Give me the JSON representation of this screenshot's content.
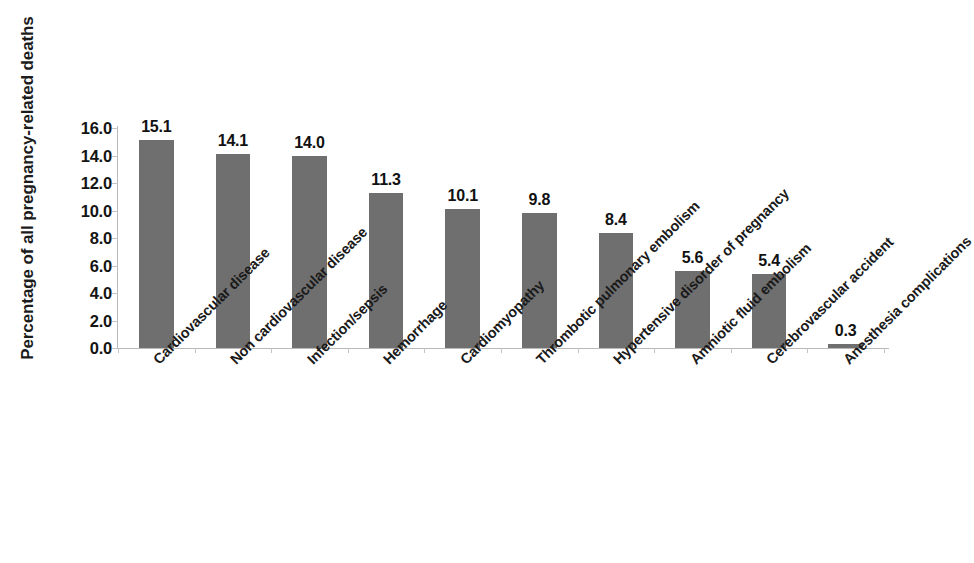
{
  "chart_data": {
    "type": "bar",
    "title": "",
    "xlabel": "",
    "ylabel": "Percentage of all pregnancy-related deaths",
    "ylim": [
      0,
      16
    ],
    "ytick_labels": [
      "16.0",
      "14.0",
      "12.0",
      "10.0",
      "8.0",
      "6.0",
      "4.0",
      "2.0",
      "0.0"
    ],
    "ytick_values": [
      16,
      14,
      12,
      10,
      8,
      6,
      4,
      2,
      0
    ],
    "grid": false,
    "legend": false,
    "bar_color": "#6f6f6f",
    "axis_color": "#b9b9b9",
    "categories": [
      "Cardiovascular disease",
      "Non cardiovascular disease",
      "Infection/sepsis",
      "Hemorrhage",
      "Cardiomyopathy",
      "Thrombotic pulmonary embolism",
      "Hypertensive disorder of pregnancy",
      "Amniotic fluid embolism",
      "Cerebrovascular accident",
      "Anesthesia complications"
    ],
    "values": [
      15.1,
      14.1,
      14.0,
      11.3,
      10.1,
      9.8,
      8.4,
      5.6,
      5.4,
      0.3
    ],
    "value_labels": [
      "15.1",
      "14.1",
      "14.0",
      "11.3",
      "10.1",
      "9.8",
      "8.4",
      "5.6",
      "5.4",
      "0.3"
    ]
  }
}
